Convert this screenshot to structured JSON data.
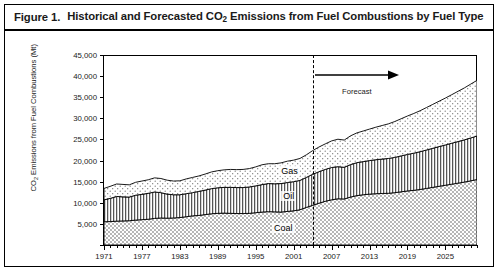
{
  "figure": {
    "number": "Figure 1.",
    "title_prefix": "Historical and Forecasted CO",
    "title_sub": "2",
    "title_suffix": " Emissions from Fuel Combustions by Fuel Type"
  },
  "chart_data": {
    "type": "area",
    "subtype": "stacked-area",
    "title": "Historical and Forecasted CO2 Emissions from Fuel Combustions by Fuel Type",
    "xlabel": "",
    "ylabel": "CO2 Emissions from Fuel Combustions (Mt)",
    "ylabel_prefix": "CO",
    "ylabel_sub": "2",
    "ylabel_suffix": " Emissions from Fuel Combustions (Mt)",
    "ylim": [
      0,
      45000
    ],
    "ytick_step": 5000,
    "ytick_labels": [
      "0",
      "5,000",
      "10,000",
      "15,000",
      "20,000",
      "25,000",
      "30,000",
      "35,000",
      "40,000",
      "45,000"
    ],
    "ytick_values": [
      0,
      5000,
      10000,
      15000,
      20000,
      25000,
      30000,
      35000,
      40000,
      45000
    ],
    "xlim": [
      1971,
      2030
    ],
    "xtick_labels": [
      "1971",
      "1977",
      "1983",
      "1989",
      "1995",
      "2001",
      "2007",
      "2013",
      "2019",
      "2025"
    ],
    "xtick_values": [
      1971,
      1977,
      1983,
      1989,
      1995,
      2001,
      2007,
      2013,
      2019,
      2025
    ],
    "grid": false,
    "legend": "inline-band-labels",
    "x": [
      1971,
      1972,
      1973,
      1974,
      1975,
      1976,
      1977,
      1978,
      1979,
      1980,
      1981,
      1982,
      1983,
      1984,
      1985,
      1986,
      1987,
      1988,
      1989,
      1990,
      1991,
      1992,
      1993,
      1994,
      1995,
      1996,
      1997,
      1998,
      1999,
      2000,
      2001,
      2002,
      2003,
      2004,
      2005,
      2006,
      2007,
      2008,
      2009,
      2010,
      2011,
      2012,
      2013,
      2014,
      2015,
      2016,
      2017,
      2018,
      2019,
      2020,
      2021,
      2022,
      2023,
      2024,
      2025,
      2026,
      2027,
      2028,
      2029,
      2030
    ],
    "series": [
      {
        "name": "Coal",
        "pattern": "fine-dotted",
        "values": [
          5500,
          5550,
          5650,
          5700,
          5750,
          5900,
          6000,
          6100,
          6300,
          6400,
          6350,
          6400,
          6500,
          6700,
          6900,
          7000,
          7200,
          7400,
          7500,
          7550,
          7500,
          7450,
          7450,
          7500,
          7650,
          7800,
          7900,
          7850,
          7800,
          7950,
          8100,
          8350,
          8900,
          9400,
          9900,
          10350,
          10700,
          10950,
          10900,
          11350,
          11700,
          11900,
          12050,
          12150,
          12200,
          12250,
          12400,
          12600,
          12800,
          12950,
          13150,
          13400,
          13650,
          13900,
          14150,
          14400,
          14650,
          14900,
          15200,
          15500
        ]
      },
      {
        "name": "Oil",
        "pattern": "vertical-lines",
        "values": [
          5200,
          5500,
          5850,
          5700,
          5600,
          5900,
          6000,
          6150,
          6250,
          6000,
          5700,
          5500,
          5400,
          5450,
          5500,
          5700,
          5800,
          5950,
          6050,
          6100,
          6150,
          6150,
          6150,
          6250,
          6350,
          6500,
          6650,
          6650,
          6750,
          6850,
          6900,
          6950,
          7100,
          7350,
          7450,
          7550,
          7650,
          7600,
          7500,
          7700,
          7800,
          7850,
          7950,
          8050,
          8150,
          8250,
          8350,
          8500,
          8650,
          8800,
          8950,
          9100,
          9250,
          9400,
          9550,
          9700,
          9850,
          10000,
          10150,
          10300
        ]
      },
      {
        "name": "Gas",
        "pattern": "coarse-dotted",
        "values": [
          2700,
          2850,
          2950,
          2950,
          2900,
          3050,
          3150,
          3200,
          3350,
          3350,
          3300,
          3250,
          3300,
          3500,
          3600,
          3650,
          3800,
          3950,
          4050,
          4150,
          4250,
          4250,
          4300,
          4350,
          4500,
          4700,
          4700,
          4750,
          4900,
          5050,
          5100,
          5200,
          5350,
          5600,
          5850,
          6050,
          6300,
          6500,
          6450,
          6800,
          7050,
          7250,
          7450,
          7700,
          7950,
          8200,
          8500,
          8800,
          9100,
          9400,
          9700,
          10050,
          10400,
          10750,
          11100,
          11500,
          11900,
          12300,
          12750,
          13200
        ]
      }
    ],
    "band_labels": [
      {
        "name": "Gas",
        "text": "Gas"
      },
      {
        "name": "Oil",
        "text": "Oil"
      },
      {
        "name": "Coal",
        "text": "Coal"
      }
    ],
    "annotations": [
      {
        "name": "forecast",
        "text": "Forecast",
        "at_year": 2011,
        "arrow": "right"
      }
    ],
    "forecast_divider_year": 2004
  }
}
